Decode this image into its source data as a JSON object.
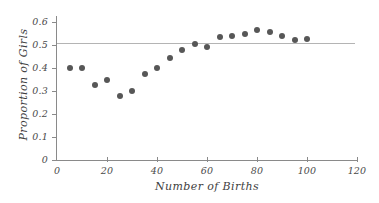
{
  "chart_data": {
    "type": "scatter",
    "title": "",
    "xlabel": "Number of Births",
    "ylabel": "Proportion of Girls",
    "xlim": [
      0,
      120
    ],
    "ylim": [
      0,
      0.6
    ],
    "xticks": [
      "0",
      "20",
      "40",
      "60",
      "80",
      "100",
      "120"
    ],
    "xtick_values": [
      0,
      20,
      40,
      60,
      80,
      100,
      120
    ],
    "yticks": [
      "0",
      "0.1",
      "0.2",
      "0.3",
      "0.4",
      "0.5",
      "0.6"
    ],
    "ytick_values": [
      0,
      0.1,
      0.2,
      0.3,
      0.4,
      0.5,
      0.6
    ],
    "grid": false,
    "legend": false,
    "x": [
      5,
      10,
      15,
      20,
      25,
      30,
      35,
      40,
      45,
      50,
      55,
      60,
      65,
      70,
      75,
      80,
      85,
      90,
      95,
      100
    ],
    "y": [
      0.4,
      0.4,
      0.325,
      0.35,
      0.28,
      0.3,
      0.375,
      0.4,
      0.445,
      0.48,
      0.505,
      0.49,
      0.535,
      0.54,
      0.55,
      0.565,
      0.555,
      0.54,
      0.52,
      0.525
    ],
    "reference_line": {
      "orientation": "horizontal",
      "value": 0.5,
      "color": "#b4b4b4"
    },
    "marker_color": "#575757",
    "axis_color": "#8a8a8a"
  }
}
